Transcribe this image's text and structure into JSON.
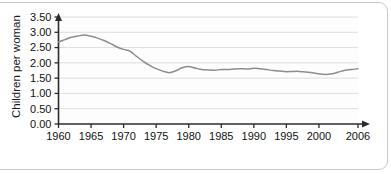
{
  "chart_data": {
    "type": "line",
    "title": "",
    "subtitle": "",
    "xlabel": "",
    "ylabel": "Children per woman",
    "xlim": [
      1960,
      2006
    ],
    "ylim": [
      0.0,
      3.5
    ],
    "grid": true,
    "legend": false,
    "legend_position": "none",
    "y_ticks": [
      "0.00",
      "0.50",
      "1.00",
      "1.50",
      "2.00",
      "2.50",
      "3.00",
      "3.50"
    ],
    "y_tick_values": [
      0.0,
      0.5,
      1.0,
      1.5,
      2.0,
      2.5,
      3.0,
      3.5
    ],
    "x_ticks": [
      "1960",
      "1965",
      "1970",
      "1975",
      "1980",
      "1985",
      "1990",
      "1995",
      "2000",
      "2006"
    ],
    "x_tick_values": [
      1960,
      1965,
      1970,
      1975,
      1980,
      1985,
      1990,
      1995,
      2000,
      2006
    ],
    "series": [
      {
        "name": "Children per woman",
        "color": "#8d8d8d",
        "x": [
          1960,
          1961,
          1962,
          1963,
          1964,
          1965,
          1966,
          1967,
          1968,
          1969,
          1970,
          1971,
          1972,
          1973,
          1974,
          1975,
          1976,
          1977,
          1978,
          1979,
          1980,
          1981,
          1982,
          1983,
          1984,
          1985,
          1986,
          1987,
          1988,
          1989,
          1990,
          1991,
          1992,
          1993,
          1994,
          1995,
          1996,
          1997,
          1998,
          1999,
          2000,
          2001,
          2002,
          2003,
          2004,
          2005,
          2006
        ],
        "values": [
          2.68,
          2.76,
          2.84,
          2.88,
          2.91,
          2.87,
          2.81,
          2.73,
          2.63,
          2.52,
          2.44,
          2.38,
          2.21,
          2.05,
          1.92,
          1.81,
          1.73,
          1.68,
          1.74,
          1.84,
          1.88,
          1.83,
          1.78,
          1.77,
          1.76,
          1.78,
          1.78,
          1.8,
          1.81,
          1.8,
          1.82,
          1.81,
          1.78,
          1.75,
          1.73,
          1.71,
          1.72,
          1.72,
          1.7,
          1.68,
          1.64,
          1.62,
          1.64,
          1.7,
          1.76,
          1.78,
          1.81
        ]
      }
    ]
  },
  "axes": {
    "y_axis_label": "Children per woman"
  }
}
